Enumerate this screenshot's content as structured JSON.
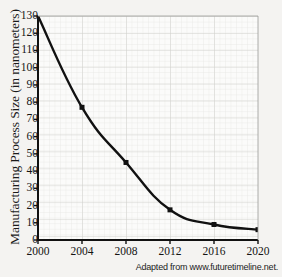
{
  "chart_data": {
    "type": "line",
    "title": "",
    "xlabel": "",
    "ylabel": "Manufacturing Process Size (in nanometers)",
    "x": [
      2000,
      2004,
      2008,
      2012,
      2016,
      2020
    ],
    "values": [
      130,
      77,
      45,
      17.5,
      9,
      6
    ],
    "series": [
      {
        "name": "Manufacturing Process Size",
        "values": [
          130,
          77,
          45,
          17.5,
          9,
          6
        ]
      }
    ],
    "xlim": [
      2000,
      2020
    ],
    "ylim": [
      0,
      130
    ],
    "x_ticks": [
      "2000",
      "2004",
      "2008",
      "2012",
      "2016",
      "2020"
    ],
    "y_ticks": [
      "0",
      "10",
      "20",
      "30",
      "40",
      "50",
      "60",
      "70",
      "80",
      "90",
      "100",
      "110",
      "120",
      "130"
    ],
    "grid": true,
    "minor_grid": true,
    "legend": "none",
    "line_color": "#111111",
    "marker_color": "#111111",
    "grid_color": "#d9d9d9",
    "background_color": "#f4f3f1",
    "plot_background_color": "#fbfbfa"
  },
  "source_note": "Adapted from www.futuretimeline.net."
}
